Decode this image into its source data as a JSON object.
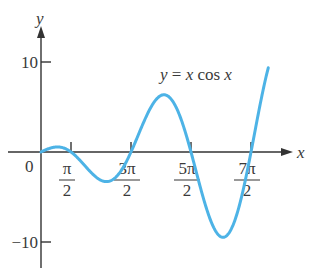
{
  "chart_data": {
    "type": "line",
    "title": "",
    "function_label": "y = x cos x",
    "xlabel": "x",
    "ylabel": "y",
    "x_ticks": [
      {
        "value": 1.5708,
        "num": "π",
        "den": "2"
      },
      {
        "value": 4.7124,
        "num": "3π",
        "den": "2"
      },
      {
        "value": 7.854,
        "num": "5π",
        "den": "2"
      },
      {
        "value": 10.9956,
        "num": "7π",
        "den": "2"
      }
    ],
    "origin_label": "0",
    "y_ticks": [
      {
        "value": 10,
        "label": "10"
      },
      {
        "value": -10,
        "label": "−10"
      }
    ],
    "xlim": [
      0,
      11.9
    ],
    "ylim": [
      -12,
      13
    ],
    "series": [
      {
        "name": "y = x cos x",
        "x": [
          0,
          0.86,
          1.5708,
          3.43,
          4.7124,
          6.44,
          7.854,
          9.53,
          10.9956,
          11.9
        ],
        "values": [
          0,
          0.56,
          0,
          -3.29,
          0,
          6.36,
          0,
          -9.48,
          0,
          8.0
        ]
      }
    ],
    "grid": false,
    "legend": "none",
    "colors": {
      "curve": "#4db3e6",
      "axis": "#333333"
    }
  }
}
